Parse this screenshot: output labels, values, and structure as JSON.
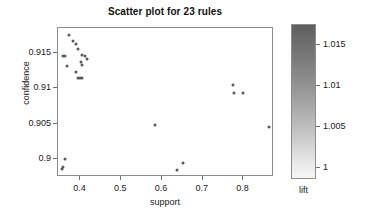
{
  "chart_data": {
    "type": "scatter",
    "title": "Scatter plot for 23 rules",
    "xlabel": "support",
    "ylabel": "confidence",
    "xlim": [
      0.345,
      0.875
    ],
    "ylim": [
      0.8975,
      0.9185
    ],
    "xticks": [
      "0.4",
      "0.5",
      "0.6",
      "0.7",
      "0.8"
    ],
    "xtick_values": [
      0.4,
      0.5,
      0.6,
      0.7,
      0.8
    ],
    "yticks": [
      "0.915",
      "0.91",
      "0.905",
      "0.9"
    ],
    "ytick_values": [
      0.915,
      0.91,
      0.905,
      0.9
    ],
    "grid": false,
    "legend_position": "right",
    "point_color": "#585858",
    "frame_color": "#8d8d8d",
    "colorbar": {
      "label": "lift",
      "ticks": [
        "1.015",
        "1.01",
        "1.005",
        "1"
      ],
      "tick_values": [
        1.015,
        1.01,
        1.005,
        1.0
      ],
      "range": [
        0.9985,
        1.0175
      ],
      "orientation": "vertical",
      "high_color": "#5f5f5f",
      "low_color": "#f6f6f6"
    },
    "n_points": 23,
    "points": [
      {
        "support": 0.372,
        "confidence": 0.9175,
        "lift": 1.016
      },
      {
        "support": 0.383,
        "confidence": 0.9167,
        "lift": 1.015
      },
      {
        "support": 0.389,
        "confidence": 0.9162,
        "lift": 1.014
      },
      {
        "support": 0.393,
        "confidence": 0.9155,
        "lift": 1.013
      },
      {
        "support": 0.357,
        "confidence": 0.9146,
        "lift": 1.012
      },
      {
        "support": 0.362,
        "confidence": 0.9145,
        "lift": 1.012
      },
      {
        "support": 0.405,
        "confidence": 0.9147,
        "lift": 1.012
      },
      {
        "support": 0.412,
        "confidence": 0.9145,
        "lift": 1.011
      },
      {
        "support": 0.416,
        "confidence": 0.9142,
        "lift": 1.011
      },
      {
        "support": 0.367,
        "confidence": 0.9132,
        "lift": 1.01
      },
      {
        "support": 0.402,
        "confidence": 0.9137,
        "lift": 1.01
      },
      {
        "support": 0.405,
        "confidence": 0.9133,
        "lift": 1.01
      },
      {
        "support": 0.39,
        "confidence": 0.9123,
        "lift": 1.008
      },
      {
        "support": 0.395,
        "confidence": 0.9114,
        "lift": 1.007
      },
      {
        "support": 0.4,
        "confidence": 0.9114,
        "lift": 1.007
      },
      {
        "support": 0.404,
        "confidence": 0.9114,
        "lift": 1.007
      },
      {
        "support": 0.774,
        "confidence": 0.9104,
        "lift": 1.004
      },
      {
        "support": 0.776,
        "confidence": 0.9094,
        "lift": 1.003
      },
      {
        "support": 0.8,
        "confidence": 0.9093,
        "lift": 1.003
      },
      {
        "support": 0.583,
        "confidence": 0.9048,
        "lift": 1.0
      },
      {
        "support": 0.862,
        "confidence": 0.9046,
        "lift": 1.0
      },
      {
        "support": 0.363,
        "confidence": 0.9001,
        "lift": 0.999
      },
      {
        "support": 0.357,
        "confidence": 0.8989,
        "lift": 0.999
      },
      {
        "support": 0.354,
        "confidence": 0.8986,
        "lift": 0.999
      },
      {
        "support": 0.651,
        "confidence": 0.8995,
        "lift": 0.999
      },
      {
        "support": 0.638,
        "confidence": 0.8985,
        "lift": 0.999
      }
    ]
  }
}
